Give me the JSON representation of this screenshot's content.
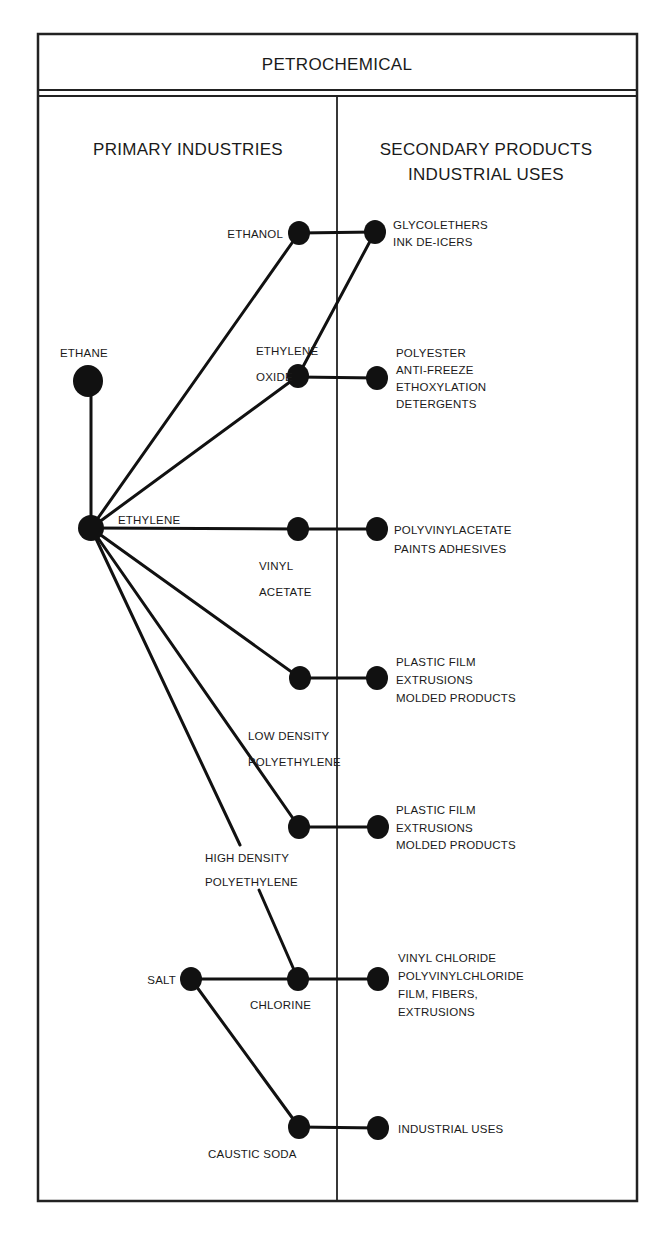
{
  "title": "PETROCHEMICAL",
  "columns": {
    "left": "PRIMARY INDUSTRIES",
    "right_line1": "SECONDARY PRODUCTS",
    "right_line2": "INDUSTRIAL USES"
  },
  "nodes": {
    "ethane": {
      "label": "ETHANE",
      "x": 88,
      "y": 381,
      "r": 15
    },
    "ethylene": {
      "label": "ETHYLENE",
      "x": 91,
      "y": 528,
      "r": 13
    },
    "ethanol": {
      "label": "ETHANOL",
      "x": 299,
      "y": 233,
      "r": 11
    },
    "ethylene_oxide": {
      "label_line1": "ETHYLENE",
      "label_line2": "OXIDE",
      "x": 298,
      "y": 376,
      "r": 11
    },
    "vinyl_acetate": {
      "label_line1": "VINYL",
      "label_line2": "ACETATE",
      "x": 298,
      "y": 529,
      "r": 11
    },
    "ldpe": {
      "label_line1": "LOW DENSITY",
      "label_line2": "POLYETHYLENE",
      "x": 300,
      "y": 678,
      "r": 11
    },
    "hdpe": {
      "label_line1": "HIGH DENSITY",
      "label_line2": "POLYETHYLENE",
      "x": 299,
      "y": 827,
      "r": 11
    },
    "salt": {
      "label": "SALT",
      "x": 191,
      "y": 979,
      "r": 11
    },
    "chlorine": {
      "label": "CHLORINE",
      "x": 298,
      "y": 979,
      "r": 11
    },
    "caustic_soda": {
      "label": "CAUSTIC SODA",
      "x": 299,
      "y": 1127,
      "r": 11
    }
  },
  "products": {
    "glycolethers": {
      "x": 375,
      "y": 232,
      "lines": [
        "GLYCOLETHERS",
        "INK DE-ICERS"
      ]
    },
    "polyester": {
      "x": 377,
      "y": 378,
      "lines": [
        "POLYESTER",
        "ANTI-FREEZE",
        "ETHOXYLATION",
        "DETERGENTS"
      ]
    },
    "polyvinylacetate": {
      "x": 377,
      "y": 529,
      "lines": [
        "POLYVINYLACETATE",
        "PAINTS ADHESIVES"
      ]
    },
    "ldpe_uses": {
      "x": 377,
      "y": 678,
      "lines": [
        "PLASTIC FILM",
        "EXTRUSIONS",
        "MOLDED PRODUCTS"
      ]
    },
    "hdpe_uses": {
      "x": 378,
      "y": 827,
      "lines": [
        "PLASTIC FILM",
        "EXTRUSIONS",
        "MOLDED PRODUCTS"
      ]
    },
    "pvc_uses": {
      "x": 378,
      "y": 979,
      "lines": [
        "VINYL CHLORIDE",
        "POLYVINYLCHLORIDE",
        "FILM, FIBERS,",
        "EXTRUSIONS"
      ]
    },
    "caustic_uses": {
      "x": 378,
      "y": 1128,
      "lines": [
        "INDUSTRIAL USES"
      ]
    }
  },
  "edges": [
    [
      "ethane",
      "ethylene"
    ],
    [
      "ethylene",
      "ethanol"
    ],
    [
      "ethylene",
      "ethylene_oxide"
    ],
    [
      "ethylene",
      "vinyl_acetate"
    ],
    [
      "ethylene",
      "ldpe"
    ],
    [
      "ethylene",
      "hdpe"
    ],
    [
      "ethylene",
      "chlorine"
    ],
    [
      "ethanol",
      "glycolethers"
    ],
    [
      "ethylene_oxide",
      "glycolethers"
    ],
    [
      "ethylene_oxide",
      "polyester"
    ],
    [
      "vinyl_acetate",
      "polyvinylacetate"
    ],
    [
      "ldpe",
      "ldpe_uses"
    ],
    [
      "hdpe",
      "hdpe_uses"
    ],
    [
      "salt",
      "chlorine"
    ],
    [
      "chlorine",
      "pvc_uses"
    ],
    [
      "salt",
      "caustic_soda"
    ],
    [
      "caustic_soda",
      "caustic_uses"
    ]
  ],
  "colors": {
    "ink": "#111111",
    "paper": "#ffffff"
  }
}
